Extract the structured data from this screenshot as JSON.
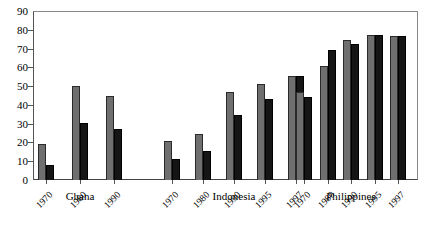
{
  "chart_data": {
    "type": "bar",
    "title": "",
    "subtitle": "",
    "xlabel": "",
    "ylabel": "",
    "ylim": [
      0,
      90
    ],
    "ytick_step": 10,
    "yticks": [
      0,
      10,
      20,
      30,
      40,
      50,
      60,
      70,
      80,
      90
    ],
    "grid": false,
    "legend": "none",
    "legend_entries": [
      "Series 1",
      "Series 2"
    ],
    "series_colors": [
      "#6f6f6f",
      "#151515"
    ],
    "groups": [
      {
        "name": "Ghana",
        "categories": [
          "1970",
          "1980",
          "1990"
        ],
        "series": [
          {
            "name": "Series 1",
            "values": [
              19,
              50,
              45
            ]
          },
          {
            "name": "Series 2",
            "values": [
              8,
              30.5,
              27
            ]
          }
        ]
      },
      {
        "name": "Indonesia",
        "categories": [
          "1970",
          "1980",
          "1990",
          "1995",
          "1997"
        ],
        "series": [
          {
            "name": "Series 1",
            "values": [
              21,
              24.5,
              47,
              51,
              55.5
            ]
          },
          {
            "name": "Series 2",
            "values": [
              11,
              15.5,
              34.5,
              43,
              55.5
            ]
          }
        ]
      },
      {
        "name": "Philippines",
        "categories": [
          "1970",
          "1980",
          "1990",
          "1995",
          "1997"
        ],
        "series": [
          {
            "name": "Series 1",
            "values": [
              47,
              60.5,
              74.5,
              77,
              76.5
            ]
          },
          {
            "name": "Series 2",
            "values": [
              44,
              69.5,
              72.5,
              77,
              76.5
            ]
          }
        ]
      }
    ]
  },
  "axis": {
    "y_tick_labels": [
      "90",
      "80",
      "70",
      "60",
      "50",
      "40",
      "30",
      "20",
      "10",
      "0"
    ]
  }
}
